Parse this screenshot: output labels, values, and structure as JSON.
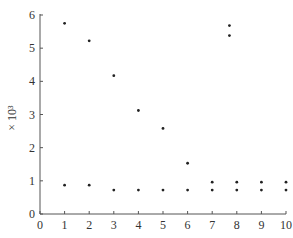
{
  "chart_data": {
    "type": "scatter",
    "title": "",
    "xlabel": "",
    "ylabel": "× 10³",
    "xlim": [
      0,
      10
    ],
    "ylim": [
      0,
      6
    ],
    "xticks": [
      0,
      1,
      2,
      3,
      4,
      5,
      6,
      7,
      8,
      9,
      10
    ],
    "yticks": [
      0,
      1,
      2,
      3,
      4,
      5,
      6
    ],
    "grid": false,
    "legend": null,
    "series": [
      {
        "name": "upper",
        "points": [
          {
            "x": 1,
            "y": 5.75
          },
          {
            "x": 2,
            "y": 5.22
          },
          {
            "x": 3,
            "y": 4.17
          },
          {
            "x": 4,
            "y": 3.12
          },
          {
            "x": 5,
            "y": 2.58
          },
          {
            "x": 6,
            "y": 1.53
          },
          {
            "x": 7.7,
            "y": 5.68
          },
          {
            "x": 7.7,
            "y": 5.38
          }
        ]
      },
      {
        "name": "lower",
        "points": [
          {
            "x": 1,
            "y": 0.87
          },
          {
            "x": 2,
            "y": 0.87
          },
          {
            "x": 3,
            "y": 0.72
          },
          {
            "x": 4,
            "y": 0.72
          },
          {
            "x": 5,
            "y": 0.72
          },
          {
            "x": 6,
            "y": 0.72
          },
          {
            "x": 7,
            "y": 0.96
          },
          {
            "x": 7,
            "y": 0.72
          },
          {
            "x": 8,
            "y": 0.96
          },
          {
            "x": 8,
            "y": 0.72
          },
          {
            "x": 9,
            "y": 0.96
          },
          {
            "x": 9,
            "y": 0.72
          },
          {
            "x": 10,
            "y": 0.96
          },
          {
            "x": 10,
            "y": 0.72
          }
        ]
      }
    ]
  },
  "plot": {
    "x0": 40,
    "x1": 286,
    "y0": 214,
    "y1": 15,
    "color_axis": "#555555",
    "color_dot": "#222222"
  }
}
